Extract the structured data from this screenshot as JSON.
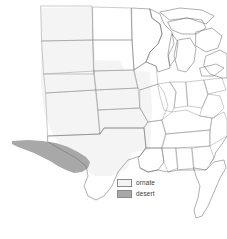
{
  "figure": {
    "type": "species-range-map",
    "region": "United States (central and eastern)",
    "background_color": "#ffffff"
  },
  "legend": {
    "position": "lower-right",
    "items": [
      {
        "key": "ornate",
        "label": "ornate",
        "swatch_fill": "#f4f4f4",
        "swatch_border": "#8a8a8a",
        "swatch_icon": "legend-swatch-ornate"
      },
      {
        "key": "desert",
        "label": "desert",
        "swatch_fill": "#a8a8a8",
        "swatch_border": "#8a8a8a",
        "swatch_icon": "legend-swatch-desert"
      }
    ]
  },
  "map": {
    "outline_color": "#6e6e6e",
    "state_border_color": "#8c8c8c",
    "ranges": [
      {
        "key": "ornate",
        "fill": "#f4f4f4",
        "description": "Great Plains region, very light fill"
      },
      {
        "key": "desert",
        "fill": "#a8a8a8",
        "description": "West Texas and southern New Mexico, medium gray fill"
      }
    ]
  }
}
